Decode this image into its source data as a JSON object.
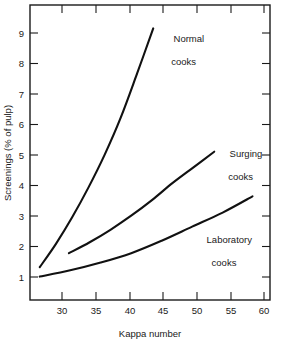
{
  "chart_data": {
    "type": "line",
    "title": "",
    "xlabel": "Kappa number",
    "ylabel": "Screenings (% of pulp)",
    "xlim": [
      27,
      64
    ],
    "ylim": [
      0.35,
      9.8
    ],
    "xticks": [
      30,
      35,
      40,
      45,
      50,
      55,
      60
    ],
    "yticks": [
      1,
      2,
      3,
      4,
      5,
      6,
      7,
      8,
      9
    ],
    "xtick_labels": [
      "30",
      "35",
      "40",
      "45",
      "50",
      "55",
      "60"
    ],
    "ytick_labels": [
      "1",
      "2",
      "3",
      "4",
      "5",
      "6",
      "7",
      "8",
      "9"
    ],
    "grid": false,
    "legend_position": "inline-annotations",
    "frame": "box",
    "tick_direction": "in",
    "series": [
      {
        "name": "Normal cooks",
        "label_line1": "Normal",
        "label_line2": "cooks",
        "color": "#111111",
        "x": [
          28.5,
          31,
          33.5,
          36,
          38.5,
          41,
          43.5,
          46
        ],
        "y": [
          1.4,
          2.15,
          3.0,
          3.95,
          5.0,
          6.2,
          7.6,
          9.05
        ]
      },
      {
        "name": "Surging cooks",
        "label_line1": "Surging",
        "label_line2": "cooks",
        "color": "#111111",
        "x": [
          33,
          36.2,
          39.4,
          42.6,
          45.8,
          49,
          52.2,
          55.4
        ],
        "y": [
          1.85,
          2.2,
          2.6,
          3.05,
          3.55,
          4.1,
          4.6,
          5.1
        ]
      },
      {
        "name": "Laboratory cooks",
        "label_line1": "Laboratory",
        "label_line2": "cooks",
        "color": "#111111",
        "x": [
          28.5,
          33.2,
          37.9,
          42.6,
          47.3,
          52,
          56.7,
          61.3
        ],
        "y": [
          1.1,
          1.3,
          1.55,
          1.85,
          2.25,
          2.7,
          3.15,
          3.67
        ]
      }
    ]
  },
  "axes": {
    "x_title": "Kappa number",
    "y_title": "Screenings (% of pulp)"
  }
}
